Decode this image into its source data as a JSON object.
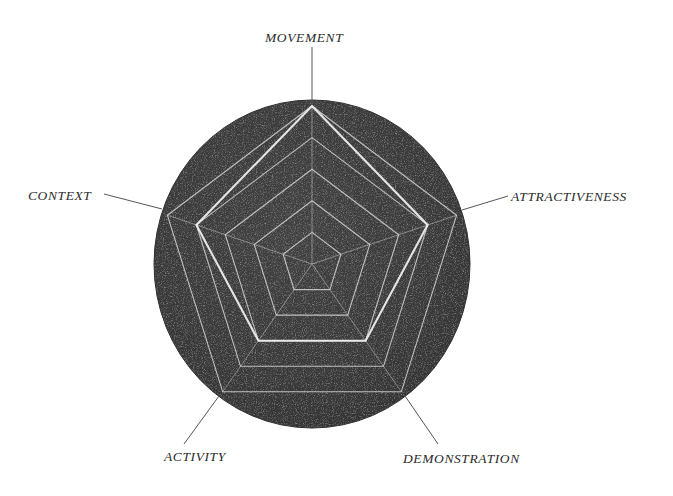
{
  "figure": {
    "kind": "radar-chart",
    "background_color": "#ffffff",
    "disc_color": "#3a3a3a",
    "grid_color": "#d8d8d8",
    "series_color": "#e8e8e8",
    "leader_color": "#5a5a5a",
    "label_color": "#2b2b2b"
  },
  "chart_data": {
    "type": "line",
    "title": "",
    "subtitle": "",
    "xlabel": "",
    "ylabel": "",
    "categories": [
      "MOVEMENT",
      "ATTRACTIVENESS",
      "DEMONSTRATION",
      "ACTIVITY",
      "CONTEXT"
    ],
    "rings": 5,
    "ring_levels": [
      1,
      2,
      3,
      4,
      5
    ],
    "ylim": [
      0,
      5
    ],
    "grid": true,
    "legend_position": "none",
    "series": [
      {
        "name": "Dimension profile",
        "values": [
          5,
          4,
          3,
          3,
          4
        ]
      }
    ],
    "annotations": []
  },
  "labels": {
    "movement": "MOVEMENT",
    "attractiveness": "ATTRACTIVENESS",
    "demonstration": "DEMONSTRATION",
    "activity": "ACTIVITY",
    "context": "CONTEXT"
  }
}
